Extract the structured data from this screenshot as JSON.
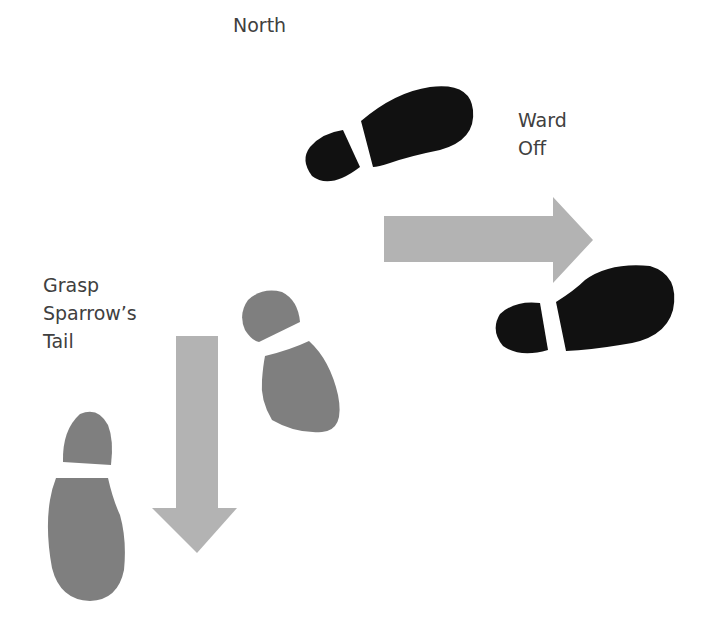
{
  "diagram": {
    "labels": {
      "north": "North",
      "ward_off_line1": "Ward",
      "ward_off_line2": "Off",
      "grasp_line1": "Grasp",
      "grasp_line2": "Sparrow’s",
      "grasp_line3": "Tail"
    },
    "colors": {
      "background": "#ffffff",
      "black_foot": "#111111",
      "gray_foot": "#7f7f7f",
      "arrow": "#b3b3b3",
      "text": "#404040"
    },
    "icons": {
      "ward_off_foot_1": "footprint-icon",
      "ward_off_foot_2": "footprint-icon",
      "grasp_foot_1": "footprint-icon",
      "grasp_foot_2": "footprint-icon",
      "right_arrow": "arrow-right-icon",
      "down_arrow": "arrow-down-icon"
    }
  }
}
